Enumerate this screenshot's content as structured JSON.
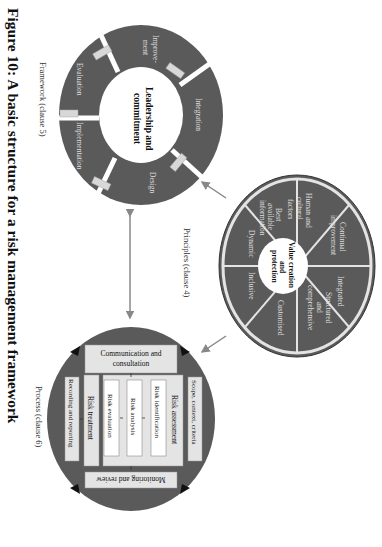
{
  "caption": "Figure 10: A basic structure for a risk management framework",
  "framework": {
    "label": "Framework (clause 5)",
    "center_line1": "Leadership and",
    "center_line2": "commitment",
    "segments": {
      "integration": "Integration",
      "design": "Design",
      "implementation": "Implementation",
      "evaluation": "Evaluation",
      "improvement_1": "Improve-",
      "improvement_2": "ment"
    }
  },
  "principles": {
    "label": "Principles (clause 4)",
    "center_line1": "Value creation",
    "center_line2": "and",
    "center_line3": "protection",
    "segments": {
      "continual_1": "Continual",
      "continual_2": "improvement",
      "integrated": "Integrated",
      "structured_1": "Structured",
      "structured_2": "and",
      "structured_3": "comprehensive",
      "customised": "Customised",
      "inclusive": "Inclusive",
      "dynamic": "Dynamic",
      "best_1": "Best",
      "best_2": "available",
      "best_3": "information",
      "human_1": "Human and",
      "human_2": "cultural",
      "human_3": "factors"
    }
  },
  "process": {
    "label": "Process (clause 6)",
    "communication_1": "Communication and",
    "communication_2": "consultation",
    "scope": "Scope, context, criteria",
    "risk_assessment": "Risk assessment",
    "risk_identification": "Risk identification",
    "risk_analysis": "Risk analysis",
    "risk_evaluation": "Risk evaluation",
    "risk_treatment": "Risk treatment",
    "monitoring": "Monitoring and review",
    "recording": "Recording and reporting"
  },
  "colors": {
    "ring": "#5a5a5a",
    "light": "#e4e4e4",
    "text_light": "#dcdcdc",
    "text_dark": "#111111",
    "arrow": "#888888"
  }
}
